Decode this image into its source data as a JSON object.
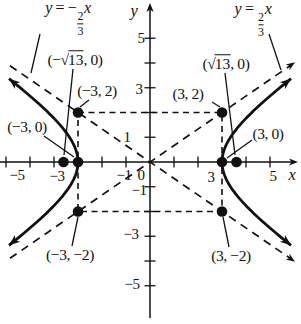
{
  "equations": {
    "left": {
      "y": "y",
      "rel": " = −",
      "num": "2",
      "den": "3",
      "x": "x"
    },
    "right": {
      "y": "y",
      "rel": " = ",
      "num": "2",
      "den": "3",
      "x": "x"
    }
  },
  "axes": {
    "x": "x",
    "y": "y"
  },
  "ticks": {
    "xm5": "−5",
    "xm3": "−3",
    "xm1": "−1",
    "x0": "0",
    "x3": "3",
    "x5": "5",
    "y5": "5",
    "y3": "3",
    "y1": "1",
    "ym1": "−1",
    "ym3": "−3",
    "ym5": "−5"
  },
  "point_labels": {
    "neg_sqrt13": {
      "pre": "(−",
      "sqrt": "√",
      "rad": "13",
      "post": ", 0)"
    },
    "pos_sqrt13": {
      "pre": "(",
      "sqrt": "√",
      "rad": "13",
      "post": ", 0)"
    },
    "neg3_2": "(−3, 2)",
    "pos3_2": "(3, 2)",
    "neg3_0": "(−3, 0)",
    "pos3_0": "(3, 0)",
    "neg3_neg2": "(−3, −2)",
    "pos3_neg2": "(3, −2)"
  },
  "chart_data": {
    "type": "line",
    "curve": {
      "equation": "x^2/9 - y^2/4 = 1",
      "a": 3,
      "b": 2,
      "orientation": "horizontal"
    },
    "asymptotes": [
      {
        "label": "y = −(2/3)x",
        "slope": -0.6667
      },
      {
        "label": "y = (2/3)x",
        "slope": 0.6667
      }
    ],
    "marked_points": [
      {
        "label": "(−√13, 0)",
        "x": -3.6056,
        "y": 0,
        "role": "focus"
      },
      {
        "label": "(√13, 0)",
        "x": 3.6056,
        "y": 0,
        "role": "focus"
      },
      {
        "label": "(−3, 0)",
        "x": -3,
        "y": 0,
        "role": "vertex"
      },
      {
        "label": "(3, 0)",
        "x": 3,
        "y": 0,
        "role": "vertex"
      },
      {
        "label": "(−3, 2)",
        "x": -3,
        "y": 2,
        "role": "rectangle-corner"
      },
      {
        "label": "(3, 2)",
        "x": 3,
        "y": 2,
        "role": "rectangle-corner"
      },
      {
        "label": "(−3, −2)",
        "x": -3,
        "y": -2,
        "role": "rectangle-corner"
      },
      {
        "label": "(3, −2)",
        "x": 3,
        "y": -2,
        "role": "rectangle-corner"
      }
    ],
    "fundamental_rectangle": {
      "x": [
        -3,
        3
      ],
      "y": [
        -2,
        2
      ]
    },
    "xlim": [
      -6.25,
      6.3
    ],
    "ylim": [
      -6.55,
      6.55
    ],
    "x_ticks": [
      -6,
      -5,
      -4,
      -3,
      -2,
      -1,
      1,
      2,
      3,
      4,
      5
    ],
    "y_ticks": [
      -5,
      -4,
      -3,
      -2,
      -1,
      1,
      2,
      3,
      4,
      5
    ],
    "labeled_x_ticks": [
      -5,
      -3,
      -1,
      0,
      3,
      5
    ],
    "labeled_y_ticks": [
      5,
      3,
      1,
      -1,
      -3,
      -5
    ],
    "grid": false,
    "legend": "none",
    "stroke_color": "#111111",
    "background_color": "#ffffff"
  }
}
